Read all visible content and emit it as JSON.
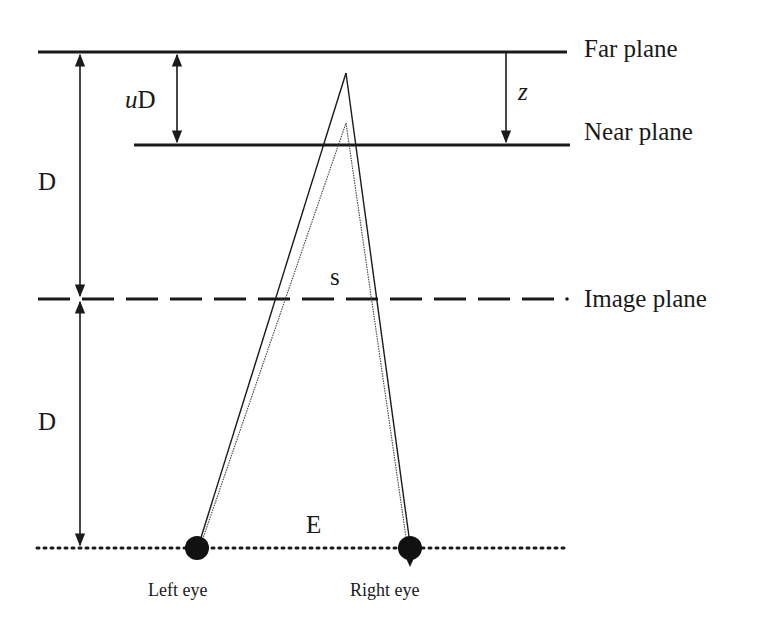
{
  "diagram": {
    "type": "stereoscopic-viewing-geometry",
    "planes": {
      "far": {
        "label": "Far plane",
        "y": 52,
        "x1": 38,
        "x2": 567,
        "style": "solid"
      },
      "near": {
        "label": "Near plane",
        "y": 145,
        "x1": 134,
        "x2": 570,
        "style": "solid"
      },
      "image": {
        "label": "Image plane",
        "y": 299,
        "x1": 38,
        "x2": 565,
        "style": "dashed"
      },
      "eyes": {
        "y": 548,
        "x1": 37,
        "x2": 568,
        "style": "dotted"
      }
    },
    "dimensions": {
      "uD": {
        "label_prefix": "u",
        "label_suffix": "D"
      },
      "z": {
        "label": "z"
      },
      "D_upper": {
        "label": "D"
      },
      "D_lower": {
        "label": "D"
      },
      "s": {
        "label": "s"
      },
      "E": {
        "label": "E"
      }
    },
    "eyes": {
      "left": {
        "label": "Left eye",
        "x": 197,
        "y": 548
      },
      "right": {
        "label": "Right eye",
        "x": 410,
        "y": 548
      }
    },
    "points": {
      "far_point": {
        "x": 346,
        "y": 73
      },
      "near_point": {
        "x": 346,
        "y": 123
      }
    },
    "colors": {
      "ink": "#1a1a1a",
      "background": "#ffffff"
    }
  }
}
